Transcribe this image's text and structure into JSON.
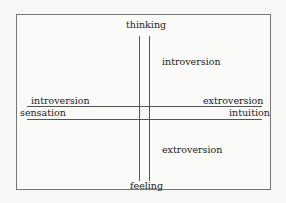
{
  "diagram": {
    "top_label": "thinking",
    "bottom_label": "feeling",
    "left_label": "sensation",
    "right_label": "intuition",
    "upper_right_label": "introversion",
    "lower_right_label": "extroversion",
    "left_above_line_label": "introversion",
    "right_above_line_label": "extroversion"
  }
}
